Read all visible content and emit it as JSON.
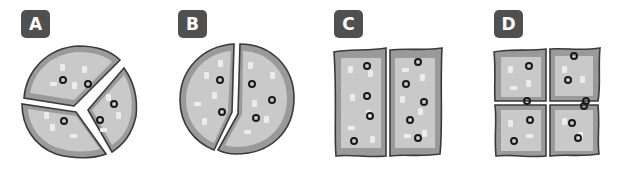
{
  "colors": {
    "badge_bg": "#505050",
    "badge_text": "#ffffff",
    "crust": "#9a9a9a",
    "cheese": "#c9c9c9",
    "outline": "#3a3a3a",
    "topping": "#ececec",
    "olive": "#1a1a1a"
  },
  "options": [
    {
      "label": "A",
      "shape": "round",
      "pieces": 3,
      "description": "round pizza cut into 3 slices"
    },
    {
      "label": "B",
      "shape": "round",
      "pieces": 2,
      "description": "round pizza cut into 2 halves"
    },
    {
      "label": "C",
      "shape": "rectangle",
      "pieces": 2,
      "description": "rectangular pizza cut into 2 halves"
    },
    {
      "label": "D",
      "shape": "square",
      "pieces": 4,
      "description": "square pizza cut into 4 quarters"
    }
  ]
}
